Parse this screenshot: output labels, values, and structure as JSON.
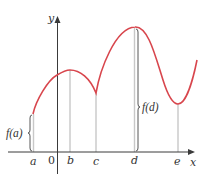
{
  "colors": {
    "curve": "#d8464d",
    "axis": "#3a3a3a",
    "guide": "#c8c8c8",
    "brace": "#444444",
    "text": "#333333"
  },
  "axes": {
    "x_label": "x",
    "y_label": "y",
    "origin_label": "0"
  },
  "points": [
    {
      "label": "a",
      "x": 33,
      "curve_y": 114
    },
    {
      "label": "b",
      "x": 70,
      "curve_y": 70
    },
    {
      "label": "c",
      "x": 96,
      "curve_y": 93
    },
    {
      "label": "d",
      "x": 135,
      "curve_y": 27
    },
    {
      "label": "e",
      "x": 178,
      "curve_y": 104
    }
  ],
  "annotations": {
    "fa": "f(a)",
    "fd": "f(d)"
  },
  "curve_description": "Red curve f(x) starting at x=a, rising to a local max at b, falling to a cusp (sharp local min) at c, rising to an absolute max at d, falling to a local min at e, then rising again."
}
